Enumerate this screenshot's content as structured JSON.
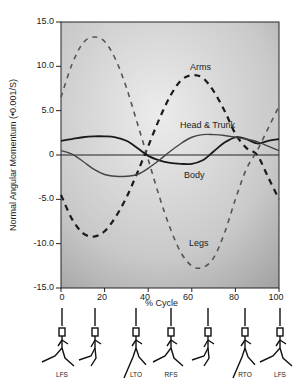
{
  "chart_data": {
    "type": "line",
    "title": "",
    "xlabel": "% Cycle",
    "ylabel": "Normal Angular Momentum (•0.001/S)",
    "xlim": [
      0,
      100
    ],
    "ylim": [
      -15.0,
      15.0
    ],
    "x_ticks": [
      "0",
      "20",
      "40",
      "60",
      "80",
      "100"
    ],
    "y_ticks": [
      "15.0",
      "10.0",
      "5.0",
      "0",
      "-5.0",
      "-10.0",
      "-15.0"
    ],
    "grid": false,
    "background": "gray gradient",
    "x": [
      0,
      5,
      10,
      15,
      20,
      25,
      30,
      35,
      40,
      45,
      50,
      55,
      60,
      65,
      70,
      75,
      80,
      85,
      90,
      95,
      100
    ],
    "series": [
      {
        "name": "Arms",
        "style": "dashed",
        "values": [
          -4.5,
          -7.2,
          -8.8,
          -9.2,
          -8.6,
          -7.0,
          -4.8,
          -2.0,
          1.0,
          4.0,
          6.6,
          8.4,
          9.0,
          8.7,
          7.2,
          5.0,
          2.4,
          0.8,
          0.0,
          -2.5,
          -5.0
        ]
      },
      {
        "name": "Legs",
        "style": "dashed",
        "values": [
          6.5,
          10.2,
          12.6,
          13.3,
          12.8,
          10.8,
          7.6,
          3.6,
          -0.5,
          -4.6,
          -8.2,
          -11.0,
          -12.5,
          -12.7,
          -11.6,
          -8.8,
          -5.0,
          -1.6,
          0.5,
          3.0,
          5.5
        ]
      },
      {
        "name": "Head & Trunk",
        "style": "solid",
        "values": [
          1.6,
          1.8,
          2.0,
          2.1,
          2.1,
          2.0,
          1.6,
          0.8,
          -0.1,
          -0.6,
          -0.9,
          -1.0,
          -1.0,
          -0.6,
          0.4,
          1.4,
          2.0,
          1.8,
          1.3,
          1.6,
          1.8
        ]
      },
      {
        "name": "Body",
        "style": "solid",
        "values": [
          0.5,
          0.1,
          -0.7,
          -1.6,
          -2.2,
          -2.4,
          -2.4,
          -2.2,
          -1.5,
          -0.6,
          0.4,
          1.3,
          2.0,
          2.3,
          2.3,
          2.2,
          2.0,
          1.8,
          1.5,
          1.0,
          0.5
        ]
      }
    ],
    "annotations": [
      "Arms",
      "Head & Trunk",
      "Body",
      "Legs"
    ],
    "gait_phases": {
      "figures": 7,
      "labels": [
        "LFS",
        "",
        "LTO",
        "RFS",
        "",
        "RTO",
        "LFS"
      ]
    }
  },
  "axes": {
    "xlabel": "% Cycle",
    "ylabel": "Normal Angular Momentum (•0.001/S)",
    "yticks": [
      "15.0",
      "10.0",
      "5.0",
      "0",
      "-5.0",
      "-10.0",
      "-15.0"
    ],
    "xticks": [
      "0",
      "20",
      "40",
      "60",
      "80",
      "100"
    ]
  },
  "labels": {
    "arms": "Arms",
    "head_trunk": "Head & Trunk",
    "body": "Body",
    "legs": "Legs"
  },
  "phases": [
    "LFS",
    "",
    "LTO",
    "RFS",
    "",
    "RTO",
    "LFS"
  ],
  "colors": {
    "arms": "#1a1a1a",
    "legs": "#555555",
    "head_trunk": "#1a1a1a",
    "body": "#444444",
    "plot_bg_light": "#e4e4e4",
    "plot_bg_dark": "#a8a8a8"
  }
}
